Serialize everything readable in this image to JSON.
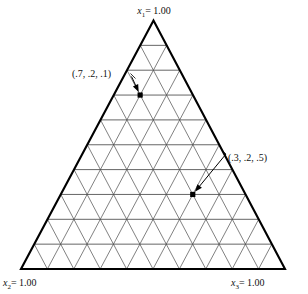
{
  "figure": {
    "title": "",
    "type": "ternary-simplex-grid"
  },
  "chart_data": {
    "type": "scatter",
    "plot_kind": "ternary-diagram",
    "title": "",
    "xlabel": "",
    "ylabel": "",
    "grid": true,
    "grid_divisions": 10,
    "axis_range": [
      0,
      1
    ],
    "vertices": [
      {
        "id": "x1",
        "label_var": "x",
        "label_sub": "1",
        "label_eq": "= 1.00",
        "label_full": "x1 = 1.00",
        "position": "top"
      },
      {
        "id": "x2",
        "label_var": "x",
        "label_sub": "2",
        "label_eq": "= 1.00",
        "label_full": "x2 = 1.00",
        "position": "bottom-left"
      },
      {
        "id": "x3",
        "label_var": "x",
        "label_sub": "3",
        "label_eq": "= 1.00",
        "label_full": "x3 = 1.00",
        "position": "bottom-right"
      }
    ],
    "points": [
      {
        "label": "(.7, .2, .1)",
        "x1": 0.7,
        "x2": 0.2,
        "x3": 0.1
      },
      {
        "label": "(.3, .2, .5)",
        "x1": 0.3,
        "x2": 0.2,
        "x3": 0.5
      }
    ],
    "annotations": [
      {
        "text": "(.7, .2, .1)",
        "arrow_to_point": 0
      },
      {
        "text": "(.3, .2, .5)",
        "arrow_to_point": 1
      }
    ],
    "colors": {
      "outline": "#000000",
      "grid": "#4a4a4a",
      "marker": "#000000",
      "text": "#111111",
      "background": "#ffffff"
    }
  }
}
